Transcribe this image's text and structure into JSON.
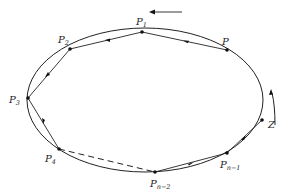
{
  "diagram": {
    "type": "polygon inscribed in ellipse with directed chords",
    "curve": {
      "shape": "ellipse",
      "cx": 145,
      "cy": 100,
      "rx": 118,
      "ry": 72
    },
    "points": [
      {
        "id": "P",
        "label": "P",
        "sub": "",
        "x": 227,
        "y": 50,
        "lx": 222,
        "ly": 44
      },
      {
        "id": "P1",
        "label": "P",
        "sub": "1",
        "x": 142,
        "y": 32,
        "lx": 136,
        "ly": 26
      },
      {
        "id": "P2",
        "label": "P",
        "sub": "2",
        "x": 70,
        "y": 49,
        "lx": 58,
        "ly": 43
      },
      {
        "id": "P3",
        "label": "P",
        "sub": "3",
        "x": 28,
        "y": 98,
        "lx": 10,
        "ly": 103
      },
      {
        "id": "P4",
        "label": "P",
        "sub": "4",
        "x": 59,
        "y": 149,
        "lx": 45,
        "ly": 162
      },
      {
        "id": "Pn-2",
        "label": "P",
        "sub": "n−2",
        "x": 155,
        "y": 172,
        "lx": 150,
        "ly": 186
      },
      {
        "id": "Pn-1",
        "label": "P",
        "sub": "n−1",
        "x": 227,
        "y": 153,
        "lx": 221,
        "ly": 167
      },
      {
        "id": "Zpt",
        "label": "",
        "sub": "",
        "x": 262,
        "y": 120,
        "lx": 0,
        "ly": 0
      }
    ],
    "chords": [
      {
        "from": "P",
        "to": "P1",
        "style": "solid",
        "arrow": "mid"
      },
      {
        "from": "P1",
        "to": "P2",
        "style": "solid",
        "arrow": "mid"
      },
      {
        "from": "P2",
        "to": "P3",
        "style": "solid",
        "arrow": "mid"
      },
      {
        "from": "P3",
        "to": "P4",
        "style": "solid",
        "arrow": "mid"
      },
      {
        "from": "P4",
        "to": "Pn-2",
        "style": "dashed",
        "arrow": "none"
      },
      {
        "from": "Pn-2",
        "to": "Pn-1",
        "style": "solid",
        "arrow": "mid"
      },
      {
        "from": "Pn-1",
        "to": "Zpt",
        "style": "solid",
        "arrow": "mid"
      }
    ],
    "direction_arrow_top": {
      "x1": 182,
      "y1": 12,
      "x2": 150,
      "y2": 12,
      "meaning": "counter-clockwise"
    },
    "direction_arrow_right": {
      "label": "Z",
      "lx": 268,
      "ly": 127
    },
    "labels": {
      "P": "P",
      "P1": "1",
      "P2": "2",
      "P3": "3",
      "P4": "4",
      "Pn2": "n−2",
      "Pn1": "n−1",
      "Z": "Z"
    }
  }
}
